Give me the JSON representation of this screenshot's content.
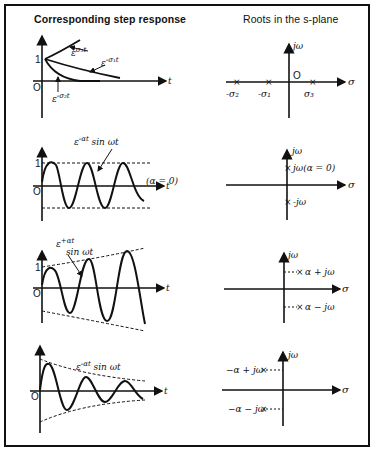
{
  "headers": {
    "left": "Corresponding step response",
    "right": "Roots in the s-plane"
  },
  "axes": {
    "time_axis": "t",
    "origin": "O",
    "unit": "1",
    "real_axis": "σ",
    "imag_axis": "jω"
  },
  "rows": [
    {
      "step_labels": [
        "ε^{σ3 t}",
        "ε^{-σ1 t}",
        "ε^{-σ2 t}"
      ],
      "step_text": {
        "a": "ε",
        "a_sup": "σ₃t",
        "b": "ε",
        "b_sup": "-σ₁t",
        "c": "ε",
        "c_sup": "-σ₂t"
      },
      "roots": [
        "-σ₂",
        "-σ₁",
        "σ₃"
      ]
    },
    {
      "step_label": "ε^{-αt} sin ωt",
      "step_text": {
        "base": "ε",
        "sup": "-αt",
        "tail": " sin ωt"
      },
      "note": "(α = 0)",
      "roots": [
        "jω(α = 0)",
        "-jω"
      ]
    },
    {
      "step_label": "ε^{+αt} sin ωt",
      "step_text": {
        "base": "ε",
        "sup": "+αt",
        "tail": " sin ωt"
      },
      "roots": [
        "α + jω",
        "α − jω"
      ]
    },
    {
      "step_label": "ε^{-αt} sin ωt",
      "step_text": {
        "base": "ε",
        "sup": "-αt",
        "tail": " sin ωt"
      },
      "roots": [
        "−α + jω",
        "−α − jω"
      ]
    }
  ]
}
